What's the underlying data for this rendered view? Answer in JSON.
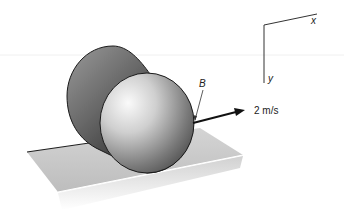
{
  "diagram": {
    "point_label": "B",
    "velocity_label": "2 m/s",
    "axes": {
      "x_label": "x",
      "y_label": "y"
    },
    "colors": {
      "plane": "#c8c8c8",
      "plane_edge": "#1e1e1e",
      "cylinder_dark": "#3a3a3a",
      "cylinder_light": "#f2f2f2",
      "arrow": "#111111",
      "axis": "#333333"
    }
  }
}
